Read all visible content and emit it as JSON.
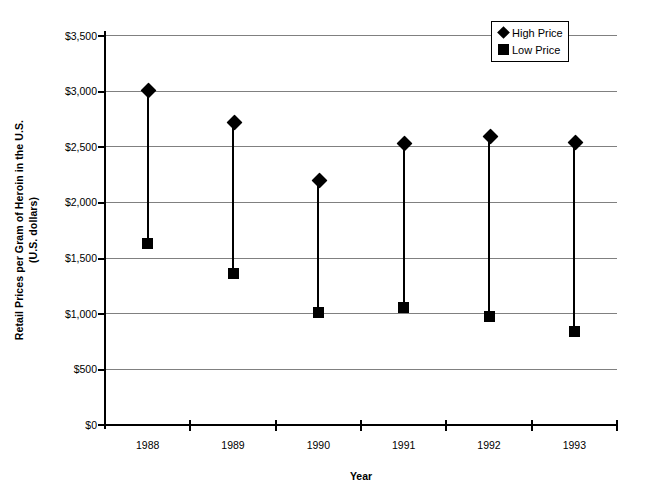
{
  "chart_data": {
    "type": "scatter",
    "title": "",
    "xlabel": "Year",
    "ylabel_line1": "Retail Prices per Gram of Heroin in the U.S.",
    "ylabel_line2": "(U.S. dollars)",
    "categories": [
      "1988",
      "1989",
      "1990",
      "1991",
      "1992",
      "1993"
    ],
    "series": [
      {
        "name": "High Price",
        "marker": "diamond",
        "values": [
          3010,
          2720,
          2200,
          2530,
          2600,
          2540
        ]
      },
      {
        "name": "Low Price",
        "marker": "square",
        "values": [
          1620,
          1350,
          1000,
          1050,
          965,
          830
        ]
      }
    ],
    "ylim": [
      0,
      3500
    ],
    "ytick_values": [
      0,
      500,
      1000,
      1500,
      2000,
      2500,
      3000,
      3500
    ],
    "ytick_labels": [
      "$0",
      "$500",
      "$1,000",
      "$1,500",
      "$2,000",
      "$2,500",
      "$3,000",
      "$3,500"
    ],
    "grid": true,
    "legend_position": "top-right",
    "colors": {
      "series": "#000000",
      "grid": "#808080",
      "axis": "#000000",
      "background": "#ffffff"
    }
  },
  "legend": {
    "entries": [
      {
        "label": "High Price",
        "icon": "diamond-marker-icon"
      },
      {
        "label": "Low Price",
        "icon": "square-marker-icon"
      }
    ]
  }
}
